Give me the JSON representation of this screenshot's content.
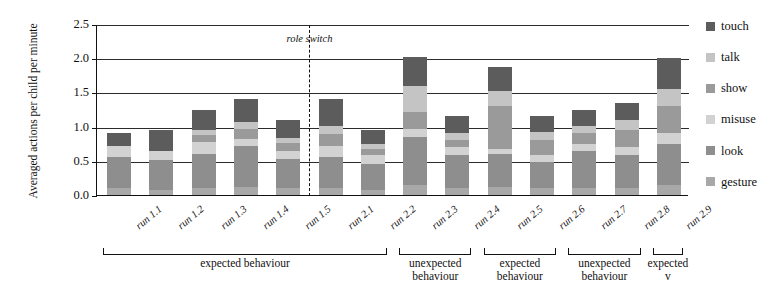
{
  "chart_data": {
    "type": "bar",
    "subtype": "stacked-bar",
    "title": "",
    "xlabel": "",
    "ylabel": "Averaged actions per child per minute",
    "ylim": [
      0.0,
      2.5
    ],
    "yticks": [
      "0.0",
      "0.5",
      "1.0",
      "1.5",
      "2.0",
      "2.5"
    ],
    "ytick_values": [
      0.0,
      0.5,
      1.0,
      1.5,
      2.0,
      2.5
    ],
    "grid": true,
    "grid_axis": "y",
    "legend_position": "right",
    "categories": [
      "run 1.1",
      "run 1.2",
      "run 1.3",
      "run 1.4",
      "run 1.5",
      "run 2.1",
      "run 2.2",
      "run 2.3",
      "run 2.4",
      "run 2.5",
      "run 2.6",
      "run 2.7",
      "run 2.8",
      "run 2.9"
    ],
    "series": [
      {
        "name": "gesture",
        "color": "#a8a8a8",
        "values": [
          0.1,
          0.08,
          0.1,
          0.12,
          0.1,
          0.1,
          0.08,
          0.15,
          0.1,
          0.12,
          0.1,
          0.1,
          0.1,
          0.15
        ]
      },
      {
        "name": "look",
        "color": "#8e8e8e",
        "values": [
          0.45,
          0.43,
          0.5,
          0.6,
          0.42,
          0.45,
          0.37,
          0.7,
          0.48,
          0.48,
          0.38,
          0.55,
          0.48,
          0.6
        ]
      },
      {
        "name": "misuse",
        "color": "#d2d2d2",
        "values": [
          0.17,
          0.14,
          0.18,
          0.1,
          0.12,
          0.16,
          0.13,
          0.12,
          0.12,
          0.08,
          0.1,
          0.1,
          0.12,
          0.15
        ]
      },
      {
        "name": "show",
        "color": "#9a9a9a",
        "values": [
          0.0,
          0.0,
          0.1,
          0.15,
          0.12,
          0.18,
          0.1,
          0.25,
          0.1,
          0.62,
          0.22,
          0.16,
          0.25,
          0.4
        ]
      },
      {
        "name": "talk",
        "color": "#c4c4c4",
        "values": [
          0.0,
          0.0,
          0.07,
          0.1,
          0.08,
          0.12,
          0.07,
          0.38,
          0.1,
          0.22,
          0.12,
          0.1,
          0.14,
          0.25
        ]
      },
      {
        "name": "touch",
        "color": "#5c5c5c",
        "values": [
          0.18,
          0.3,
          0.3,
          0.33,
          0.26,
          0.4,
          0.2,
          0.42,
          0.25,
          0.35,
          0.23,
          0.24,
          0.26,
          0.45
        ]
      }
    ],
    "totals": [
      0.9,
      0.95,
      1.25,
      1.4,
      1.1,
      1.41,
      0.95,
      2.02,
      1.15,
      1.87,
      1.15,
      1.25,
      1.35,
      2.0
    ],
    "annotations": [
      {
        "name": "role-switch",
        "text": "role switch",
        "after_category": "run 1.5",
        "style": "dashed-vertical-line"
      }
    ],
    "groups": [
      {
        "label_line1": "expected",
        "label_line2": "behaviour",
        "from": "run 1.1",
        "to": "run 2.2"
      },
      {
        "label_line1": "unexpected",
        "label_line2": "behaviour",
        "from": "run 2.3",
        "to": "run 2.4"
      },
      {
        "label_line1": "expected",
        "label_line2": "behaviour",
        "from": "run 2.5",
        "to": "run 2.6"
      },
      {
        "label_line1": "unexpected",
        "label_line2": "behaviour",
        "from": "run 2.7",
        "to": "run 2.8"
      },
      {
        "label_line1": "expected",
        "label_line2": "v",
        "from": "run 2.9",
        "to": "run 2.9"
      }
    ]
  },
  "legend": {
    "items": [
      {
        "label": "touch",
        "color": "#5c5c5c"
      },
      {
        "label": "talk",
        "color": "#c4c4c4"
      },
      {
        "label": "show",
        "color": "#9a9a9a"
      },
      {
        "label": "misuse",
        "color": "#d2d2d2"
      },
      {
        "label": "look",
        "color": "#8e8e8e"
      },
      {
        "label": "gesture",
        "color": "#a8a8a8"
      }
    ]
  },
  "group_labels_flat": [
    "expected behaviour",
    "unexpected behaviour",
    "expected behaviour",
    "unexpected behaviour",
    "expected v"
  ]
}
